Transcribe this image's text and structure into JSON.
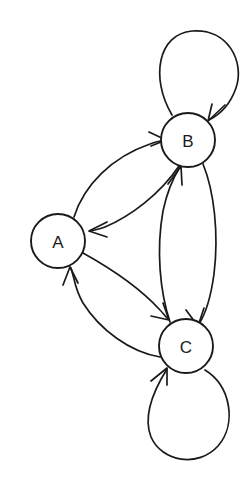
{
  "diagram": {
    "type": "directed-graph",
    "canvas": {
      "width": 248,
      "height": 483,
      "background": "#ffffff"
    },
    "style": {
      "stroke": "#1a1a1a",
      "node_fill": "#ffffff",
      "stroke_width": 1.7,
      "node_radius": 27
    },
    "nodes": [
      {
        "id": "A",
        "label": "A",
        "cx": 58,
        "cy": 241,
        "r": 27
      },
      {
        "id": "B",
        "label": "B",
        "cx": 188,
        "cy": 140,
        "r": 27
      },
      {
        "id": "C",
        "label": "C",
        "cx": 186,
        "cy": 346,
        "r": 27
      }
    ],
    "edges": [
      {
        "id": "A-B",
        "from": "A",
        "to": "B",
        "kind": "curve",
        "direction": "A to B"
      },
      {
        "id": "B-A",
        "from": "B",
        "to": "A",
        "kind": "curve",
        "direction": "B to A"
      },
      {
        "id": "A-C",
        "from": "A",
        "to": "C",
        "kind": "curve",
        "direction": "A to C"
      },
      {
        "id": "C-A",
        "from": "C",
        "to": "A",
        "kind": "curve",
        "direction": "C to A"
      },
      {
        "id": "B-C",
        "from": "B",
        "to": "C",
        "kind": "curve",
        "direction": "B to C"
      },
      {
        "id": "C-B",
        "from": "C",
        "to": "B",
        "kind": "curve",
        "direction": "C to B"
      },
      {
        "id": "B-B",
        "from": "B",
        "to": "B",
        "kind": "self-loop",
        "direction": "B to B"
      },
      {
        "id": "C-C",
        "from": "C",
        "to": "C",
        "kind": "self-loop",
        "direction": "C to C"
      }
    ]
  }
}
